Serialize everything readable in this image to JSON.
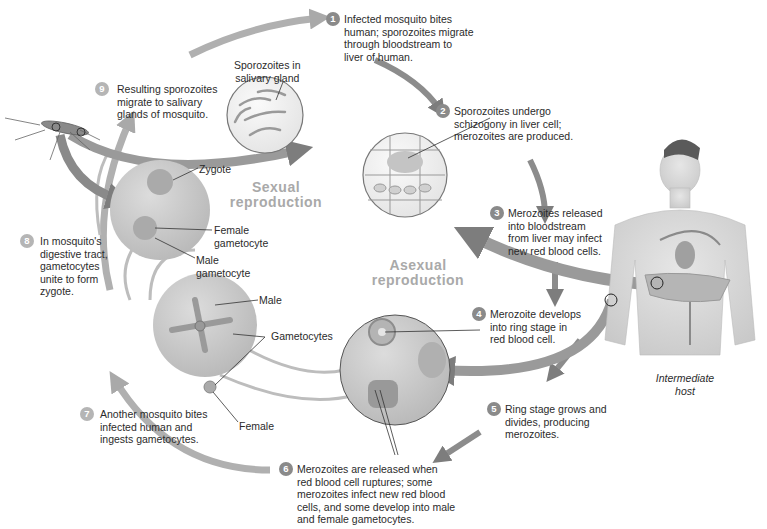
{
  "diagram": {
    "title_sexual": "Sexual\nreproduction",
    "title_asexual": "Asexual\nreproduction",
    "host_label": "Intermediate\nhost",
    "steps": [
      {
        "num": "1",
        "text": "Infected mosquito bites\nhuman; sporozoites migrate\nthrough bloodstream to\nliver of human."
      },
      {
        "num": "2",
        "text": "Sporozoites undergo\nschizogony in liver cell;\nmerozoites are produced."
      },
      {
        "num": "3",
        "text": "Merozoites released\ninto bloodstream\nfrom liver may infect\nnew red blood cells."
      },
      {
        "num": "4",
        "text": "Merozoite develops\ninto ring stage in\nred blood cell."
      },
      {
        "num": "5",
        "text": "Ring stage grows and\ndivides, producing\nmerozoites."
      },
      {
        "num": "6",
        "text": "Merozoites are released when\nred blood cell ruptures; some\nmerozoites infect new red blood\ncells, and some develop into male\nand female gametocytes."
      },
      {
        "num": "7",
        "text": "Another mosquito bites\ninfected human and\ningests gametocytes."
      },
      {
        "num": "8",
        "text": "In mosquito's\ndigestive tract,\ngametocytes\nunite to form\nzygote."
      },
      {
        "num": "9",
        "text": "Resulting sporozoites\nmigrate to salivary\nglands of mosquito."
      }
    ],
    "labels": {
      "sporozoites_gland": "Sporozoites in\nsalivary gland",
      "zygote": "Zygote",
      "female_gametocyte": "Female\ngametocyte",
      "male_gametocyte": "Male\ngametocyte",
      "male": "Male",
      "gametocytes": "Gametocytes",
      "female": "Female"
    },
    "colors": {
      "arrow": "#a9a9a9",
      "arrow_dark": "#7d7d7d",
      "circle": "#c9c9c9",
      "badge": "#8a8a8a",
      "title": "#a9a9a9"
    }
  }
}
